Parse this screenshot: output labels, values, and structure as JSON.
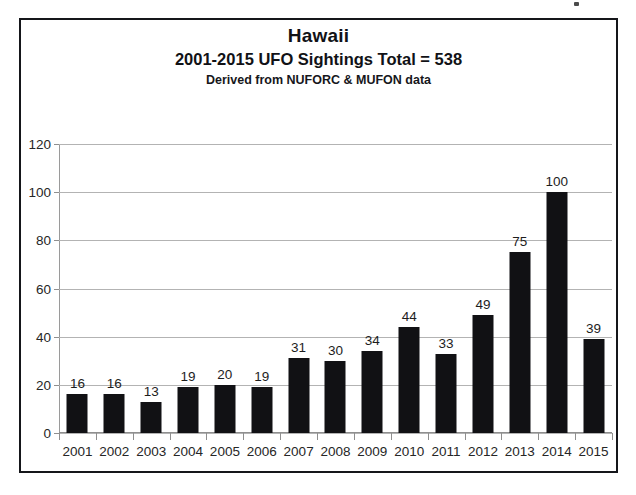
{
  "chart_data": {
    "type": "bar",
    "title": "Hawaii",
    "subtitle": "2001-2015 UFO Sightings Total = 538",
    "source_note": "Derived from NUFORC & MUFON data",
    "xlabel": "",
    "ylabel": "",
    "ylim": [
      0,
      120
    ],
    "ytick_step": 20,
    "yticks": [
      0,
      20,
      40,
      60,
      80,
      100,
      120
    ],
    "grid": true,
    "legend": false,
    "bar_color": "#111114",
    "show_data_labels": true,
    "categories": [
      "2001",
      "2002",
      "2003",
      "2004",
      "2005",
      "2006",
      "2007",
      "2008",
      "2009",
      "2010",
      "2011",
      "2012",
      "2013",
      "2014",
      "2015"
    ],
    "values": [
      16,
      16,
      13,
      19,
      20,
      19,
      31,
      30,
      34,
      44,
      33,
      49,
      75,
      100,
      39
    ],
    "total": 538
  },
  "frame": {
    "border_color": "#15161a"
  }
}
